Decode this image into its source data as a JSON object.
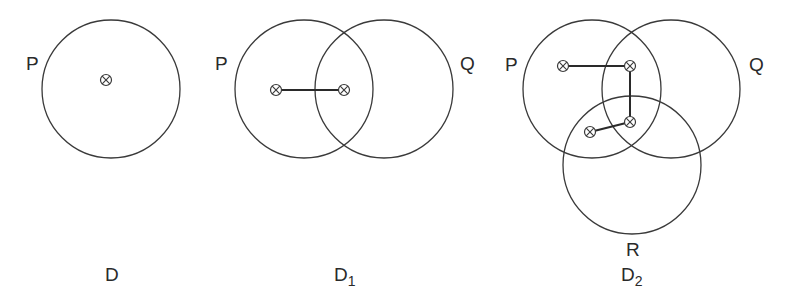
{
  "colors": {
    "line": "#3a3a3a",
    "text": "#2a2a2a",
    "background": "#ffffff"
  },
  "diagrams": [
    {
      "id": "D",
      "caption": "D",
      "caption_sub": "",
      "caption_pos": [
        105,
        281
      ],
      "circles": [
        {
          "label": "P",
          "cx": 111,
          "cy": 89,
          "r": 69,
          "label_pos": [
            26,
            70
          ]
        }
      ],
      "markers": [
        [
          106,
          80
        ]
      ],
      "links": []
    },
    {
      "id": "D1",
      "caption": "D",
      "caption_sub": "1",
      "caption_pos": [
        334,
        281
      ],
      "circles": [
        {
          "label": "P",
          "cx": 304,
          "cy": 89,
          "r": 69,
          "label_pos": [
            215,
            70
          ]
        },
        {
          "label": "Q",
          "cx": 384,
          "cy": 89,
          "r": 69,
          "label_pos": [
            460,
            70
          ]
        }
      ],
      "markers": [
        [
          276,
          90
        ],
        [
          344,
          90
        ]
      ],
      "links": [
        [
          0,
          1
        ]
      ]
    },
    {
      "id": "D2",
      "caption": "D",
      "caption_sub": "2",
      "caption_pos": [
        621,
        281
      ],
      "circles": [
        {
          "label": "P",
          "cx": 592,
          "cy": 89,
          "r": 69,
          "label_pos": [
            505,
            71
          ]
        },
        {
          "label": "Q",
          "cx": 671,
          "cy": 89,
          "r": 69,
          "label_pos": [
            749,
            71
          ]
        },
        {
          "label": "R",
          "cx": 632,
          "cy": 165,
          "r": 69,
          "label_pos": [
            626,
            256
          ]
        }
      ],
      "markers": [
        [
          563,
          66
        ],
        [
          630,
          66
        ],
        [
          630,
          122
        ],
        [
          590,
          132
        ]
      ],
      "links": [
        [
          0,
          1
        ],
        [
          1,
          2
        ],
        [
          2,
          3
        ]
      ]
    }
  ]
}
